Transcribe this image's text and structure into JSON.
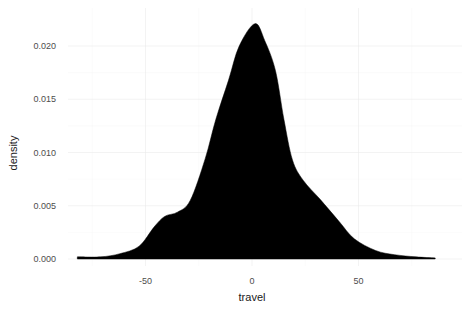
{
  "chart_data": {
    "type": "area",
    "subtype": "density",
    "title": "",
    "xlabel": "travel",
    "ylabel": "density",
    "xlim": [
      -85,
      90
    ],
    "ylim": [
      -0.0008,
      0.0225
    ],
    "x_ticks": [
      -50,
      0,
      50
    ],
    "x_tick_labels": [
      "-50",
      "0",
      "50"
    ],
    "y_ticks": [
      0.0,
      0.005,
      0.01,
      0.015,
      0.02
    ],
    "y_tick_labels": [
      "0.000",
      "0.005",
      "0.010",
      "0.015",
      "0.020"
    ],
    "grid": true,
    "legend": "none",
    "fill_color": "#000000",
    "series": [
      {
        "name": "travel density",
        "x": [
          -82,
          -71,
          -62,
          -53,
          -46,
          -41,
          -35,
          -29,
          -22,
          -17,
          -11,
          -6,
          1.4,
          6,
          11,
          15,
          19,
          24,
          32,
          41,
          48,
          58,
          67,
          77,
          86
        ],
        "values": [
          0.0002,
          0.0002,
          0.0005,
          0.0012,
          0.003,
          0.004,
          0.0044,
          0.0055,
          0.0094,
          0.0131,
          0.0168,
          0.02,
          0.0221,
          0.0205,
          0.0177,
          0.0131,
          0.0093,
          0.0074,
          0.0056,
          0.0035,
          0.0019,
          0.0008,
          0.0004,
          0.0002,
          0.0001
        ]
      }
    ]
  }
}
